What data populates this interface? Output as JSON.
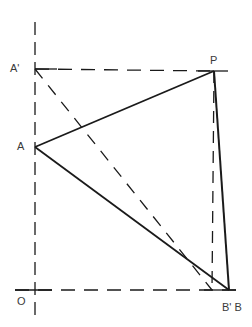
{
  "diagram": {
    "colors": {
      "ink": "#1a1a1a",
      "label": "#3a3a3a",
      "background": "#ffffff"
    },
    "points": {
      "O": {
        "label": "O",
        "x": 35,
        "y": 290
      },
      "A": {
        "label": "A",
        "x": 35,
        "y": 147
      },
      "A_prime": {
        "label": "A'",
        "x": 35,
        "y": 69
      },
      "P": {
        "label": "P",
        "x": 214,
        "y": 71
      },
      "B_prime": {
        "label": "B'",
        "x": 212,
        "y": 290
      },
      "B": {
        "label": "B",
        "x": 229,
        "y": 290
      }
    },
    "labels": {
      "A_prime": "A'",
      "P": "P",
      "A": "A",
      "O": "O",
      "B_prime_B": "B' B"
    },
    "solid_segments": [
      {
        "from": "A",
        "to": "P"
      },
      {
        "from": "A",
        "to": "B"
      },
      {
        "from": "P",
        "to": "B"
      }
    ],
    "dashed_segments": [
      {
        "from": "A_prime",
        "to": "P"
      },
      {
        "from": "A_prime",
        "to": "B_prime"
      },
      {
        "from": "P",
        "to": "B_prime"
      },
      {
        "name": "vertical-axis",
        "from": "top",
        "to": "bottom"
      },
      {
        "name": "horizontal-axis",
        "from": "left",
        "to": "right"
      }
    ]
  }
}
